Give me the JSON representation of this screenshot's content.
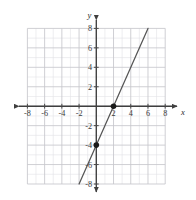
{
  "chart_data": {
    "type": "line",
    "title": "",
    "subtitle": "",
    "xlabel": "x",
    "ylabel": "y",
    "xlim": [
      -8,
      8
    ],
    "ylim": [
      -8,
      8
    ],
    "grid": true,
    "minor_grid_step": 1,
    "major_grid_step": 2,
    "legend": "none",
    "x_tick_labels": [
      "-8",
      "-6",
      "-4",
      "-2",
      "2",
      "4",
      "6",
      "8"
    ],
    "x_tick_values": [
      -8,
      -6,
      -4,
      -2,
      2,
      4,
      6,
      8
    ],
    "y_tick_labels": [
      "8",
      "6",
      "4",
      "2",
      "-2",
      "-4",
      "-6",
      "-8"
    ],
    "y_tick_values": [
      8,
      6,
      4,
      2,
      -2,
      -4,
      -6,
      -8
    ],
    "series": [
      {
        "name": "y = 2x - 4",
        "slope": 2,
        "intercept": -4,
        "x": [
          -2,
          6
        ],
        "values": [
          -8,
          8
        ],
        "color": "#555555",
        "style": "solid"
      }
    ],
    "points": [
      {
        "label": "(0, -4)",
        "x": 0,
        "y": -4,
        "marker": "filled-circle",
        "color": "#1a1a1a"
      },
      {
        "label": "(2, 0)",
        "x": 2,
        "y": 0,
        "marker": "filled-circle",
        "color": "#1a1a1a"
      }
    ],
    "colors": {
      "background": "#ffffff",
      "minor_grid": "#e2e2e6",
      "major_grid": "#c6c6cc",
      "axis": "#4a4a4a",
      "line": "#555555",
      "point": "#1a1a1a",
      "label": "#3a3a3a"
    }
  }
}
